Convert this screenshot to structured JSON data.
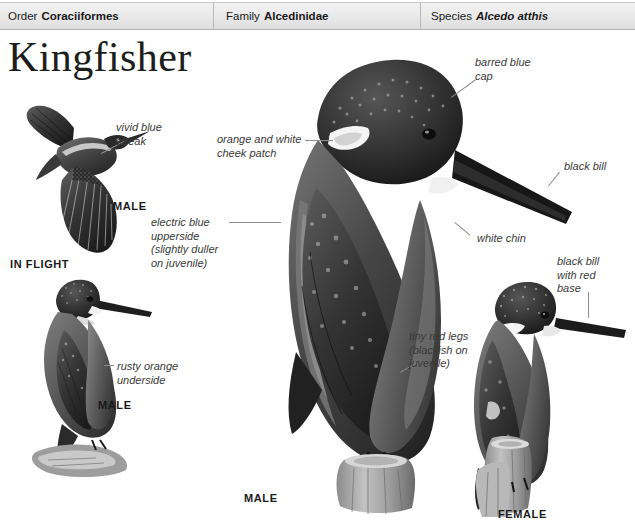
{
  "taxonomy": {
    "order": {
      "rank": "Order",
      "name": "Coraciiformes"
    },
    "family": {
      "rank": "Family",
      "name": "Alcedinidae"
    },
    "species": {
      "rank": "Species",
      "name": "Alcedo atthis"
    }
  },
  "title": "Kingfisher",
  "annotations": {
    "vivid_blue_streak": "vivid blue\nstreak",
    "orange_white_cheek": "orange and white\ncheek patch",
    "barred_blue_cap": "barred blue\ncap",
    "black_bill": "black bill",
    "electric_blue_upperside": "electric blue\nupperside\n(slightly duller\non juvenile)",
    "white_chin": "white chin",
    "black_bill_red_base": "black bill\nwith red\nbase",
    "tiny_red_legs": "tiny red legs\n(blackish on\njuvenile)",
    "rusty_orange_underside": "rusty orange\nunderside"
  },
  "captions": {
    "flight_male": "MALE",
    "in_flight": "IN FLIGHT",
    "perched_male_left": "MALE",
    "main_male": "MALE",
    "female": "FEMALE"
  },
  "colors": {
    "header_background": "#e8e8e8",
    "header_border": "#b4b4b4",
    "text": "#1a1a1a",
    "annotation_text": "#3a3a3a",
    "leader_line": "#8e8e8e",
    "plate_dark": "#2b2b2b",
    "plate_mid": "#6e6e6e",
    "plate_light": "#bdbdbd"
  }
}
